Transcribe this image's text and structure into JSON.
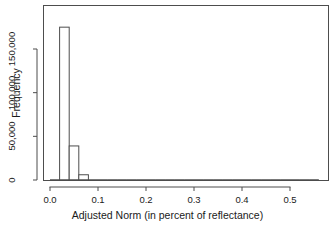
{
  "chart_data": {
    "type": "bar",
    "title": "",
    "xlabel": "Adjusted Norm (in percent of reflectance)",
    "ylabel": "Frequency",
    "xlim": [
      -0.004,
      0.565
    ],
    "ylim": [
      0,
      180000
    ],
    "grid": false,
    "legend": null,
    "xticks": [
      0.0,
      0.1,
      0.2,
      0.3,
      0.4,
      0.5
    ],
    "xtick_labels": [
      "0.0",
      "0.1",
      "0.2",
      "0.3",
      "0.4",
      "0.5"
    ],
    "yticks": [
      0,
      50000,
      100000,
      150000
    ],
    "ytick_labels": [
      "0",
      "50,000",
      "100,000",
      "150,000"
    ],
    "bin_width": 0.02,
    "bins": [
      {
        "x0": 0.0,
        "x1": 0.02,
        "value": 700
      },
      {
        "x0": 0.02,
        "x1": 0.04,
        "value": 175000
      },
      {
        "x0": 0.04,
        "x1": 0.06,
        "value": 39000
      },
      {
        "x0": 0.06,
        "x1": 0.08,
        "value": 6000
      },
      {
        "x0": 0.08,
        "x1": 0.1,
        "value": 900
      },
      {
        "x0": 0.1,
        "x1": 0.12,
        "value": 300
      },
      {
        "x0": 0.12,
        "x1": 0.14,
        "value": 150
      },
      {
        "x0": 0.14,
        "x1": 0.16,
        "value": 100
      },
      {
        "x0": 0.16,
        "x1": 0.18,
        "value": 80
      },
      {
        "x0": 0.18,
        "x1": 0.2,
        "value": 60
      },
      {
        "x0": 0.2,
        "x1": 0.22,
        "value": 50
      },
      {
        "x0": 0.22,
        "x1": 0.24,
        "value": 40
      },
      {
        "x0": 0.24,
        "x1": 0.26,
        "value": 35
      },
      {
        "x0": 0.26,
        "x1": 0.28,
        "value": 30
      },
      {
        "x0": 0.28,
        "x1": 0.3,
        "value": 25
      },
      {
        "x0": 0.3,
        "x1": 0.32,
        "value": 22
      },
      {
        "x0": 0.32,
        "x1": 0.34,
        "value": 20
      },
      {
        "x0": 0.34,
        "x1": 0.36,
        "value": 18
      },
      {
        "x0": 0.36,
        "x1": 0.38,
        "value": 15
      },
      {
        "x0": 0.38,
        "x1": 0.4,
        "value": 13
      },
      {
        "x0": 0.4,
        "x1": 0.42,
        "value": 12
      },
      {
        "x0": 0.42,
        "x1": 0.44,
        "value": 10
      },
      {
        "x0": 0.44,
        "x1": 0.46,
        "value": 9
      },
      {
        "x0": 0.46,
        "x1": 0.48,
        "value": 8
      },
      {
        "x0": 0.48,
        "x1": 0.5,
        "value": 7
      },
      {
        "x0": 0.5,
        "x1": 0.52,
        "value": 6
      },
      {
        "x0": 0.52,
        "x1": 0.54,
        "value": 5
      },
      {
        "x0": 0.54,
        "x1": 0.56,
        "value": 4
      }
    ],
    "colors": {
      "bar_fill": "#ffffff",
      "bar_stroke": "#4d4d4d",
      "axis": "#4d4d4d",
      "text": "#1a1a1a",
      "background": "#ffffff"
    }
  }
}
